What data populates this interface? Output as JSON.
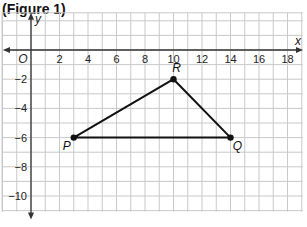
{
  "figure": {
    "title": "(Figure 1)"
  },
  "colors": {
    "grid": "#c9c9c9",
    "axis": "#333333",
    "shape": "#111111",
    "background": "#ffffff"
  },
  "chart_data": {
    "type": "scatter",
    "title": "(Figure 1)",
    "xlabel": "x",
    "ylabel": "y",
    "origin_label": "O",
    "xlim": [
      -2,
      19
    ],
    "ylim": [
      -11,
      2
    ],
    "grid": true,
    "x_ticks": [
      2,
      4,
      6,
      8,
      10,
      12,
      14,
      16,
      18
    ],
    "y_ticks": [
      -2,
      -4,
      -6,
      -8,
      -10
    ],
    "points": [
      {
        "label": "P",
        "x": 3,
        "y": -6
      },
      {
        "label": "Q",
        "x": 14,
        "y": -6
      },
      {
        "label": "R",
        "x": 10,
        "y": -2
      }
    ],
    "polygon": [
      "P",
      "Q",
      "R"
    ],
    "legend": null
  }
}
